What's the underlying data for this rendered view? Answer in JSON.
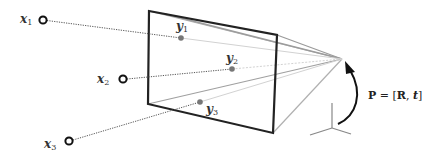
{
  "diagram": {
    "type": "camera-projection",
    "colors": {
      "background": "#ffffff",
      "frame": "#222222",
      "ray_light": "#c8c8c8",
      "ray_medium": "#a8a8a8",
      "dotted_ray": "#555555",
      "image_point": "#777777",
      "world_point_stroke": "#111111",
      "arrow": "#111111"
    },
    "world_points": [
      {
        "name": "x",
        "sub": "1",
        "label_x": 20,
        "label_y": 12,
        "cx": 43,
        "cy": 20
      },
      {
        "name": "x",
        "sub": "2",
        "label_x": 97,
        "label_y": 73,
        "cx": 123,
        "cy": 79
      },
      {
        "name": "x",
        "sub": "3",
        "label_x": 44,
        "label_y": 138,
        "cx": 69,
        "cy": 141
      }
    ],
    "image_points": [
      {
        "name": "y",
        "sub": "1",
        "label_x": 176,
        "label_y": 20,
        "cx": 181,
        "cy": 38
      },
      {
        "name": "y",
        "sub": "2",
        "label_x": 226,
        "label_y": 52,
        "cx": 232,
        "cy": 69
      },
      {
        "name": "y",
        "sub": "3",
        "label_x": 206,
        "label_y": 103,
        "cx": 200,
        "cy": 102
      }
    ],
    "image_plane": {
      "corners": [
        [
          149,
          11
        ],
        [
          277,
          35
        ],
        [
          273,
          133
        ],
        [
          148,
          104
        ]
      ]
    },
    "camera_center": {
      "x": 342,
      "y": 59
    },
    "world_origin": {
      "x": 332,
      "y": 128
    },
    "pose_label": {
      "P": "P",
      "eq": " = [",
      "R": "R",
      "comma": ", ",
      "t": "t",
      "close": "]"
    }
  }
}
